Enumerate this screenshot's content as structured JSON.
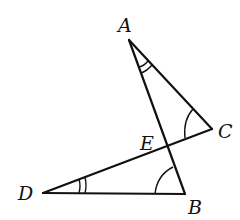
{
  "diagram": {
    "type": "geometry",
    "stroke_color": "#111111",
    "background": "#ffffff",
    "points": {
      "A": {
        "label": "A",
        "x": 129,
        "y": 40,
        "label_x": 118,
        "label_y": 32
      },
      "B": {
        "label": "B",
        "x": 185,
        "y": 194,
        "label_x": 188,
        "label_y": 214
      },
      "C": {
        "label": "C",
        "x": 212,
        "y": 129,
        "label_x": 218,
        "label_y": 138
      },
      "D": {
        "label": "D",
        "x": 43,
        "y": 193,
        "label_x": 18,
        "label_y": 200
      },
      "E": {
        "label": "E",
        "x": 167,
        "y": 147,
        "label_x": 140,
        "label_y": 150
      }
    },
    "segments": [
      {
        "from": "A",
        "to": "B"
      },
      {
        "from": "A",
        "to": "C"
      },
      {
        "from": "D",
        "to": "C"
      },
      {
        "from": "D",
        "to": "B"
      }
    ],
    "angle_marks": [
      {
        "vertex": "A",
        "arcs": 2
      },
      {
        "vertex": "C",
        "arcs": 1
      },
      {
        "vertex": "D",
        "arcs": 2
      },
      {
        "vertex": "B",
        "arcs": 1
      }
    ],
    "intersection": {
      "point": "E",
      "of": [
        "AB",
        "CD"
      ]
    }
  }
}
